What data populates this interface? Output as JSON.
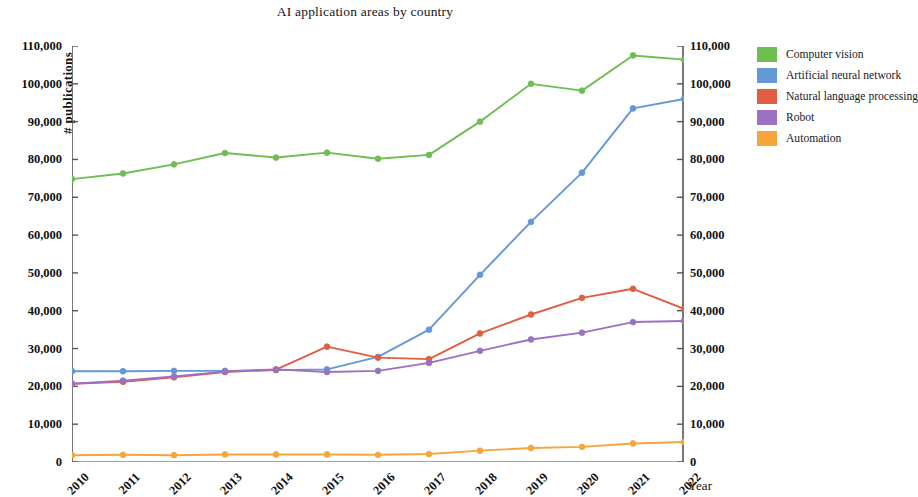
{
  "chart_data": {
    "type": "line",
    "title": "AI application areas by country",
    "xlabel": "Year",
    "ylabel": "# publications",
    "categories": [
      "2010",
      "2011",
      "2012",
      "2013",
      "2014",
      "2015",
      "2016",
      "2017",
      "2018",
      "2019",
      "2020",
      "2021",
      "2022"
    ],
    "x": [
      2010,
      2011,
      2012,
      2013,
      2014,
      2015,
      2016,
      2017,
      2018,
      2019,
      2020,
      2021,
      2022
    ],
    "ylim": [
      0,
      110000
    ],
    "ytick_labels": [
      "0",
      "10,000",
      "20,000",
      "30,000",
      "40,000",
      "50,000",
      "60,000",
      "70,000",
      "80,000",
      "90,000",
      "100,000",
      "110,000"
    ],
    "ytick_values": [
      0,
      10000,
      20000,
      30000,
      40000,
      50000,
      60000,
      70000,
      80000,
      90000,
      100000,
      110000
    ],
    "right_axis_mirror": true,
    "grid": false,
    "legend_position": "right",
    "markers": true,
    "series": [
      {
        "name": "Computer vision",
        "color": "#6EBE52",
        "values": [
          74800,
          76300,
          78700,
          81700,
          80500,
          81800,
          80200,
          81200,
          90000,
          100000,
          98200,
          107500,
          106400
        ]
      },
      {
        "name": "Artificial neural network",
        "color": "#6397D8",
        "values": [
          24000,
          24000,
          24100,
          24100,
          24300,
          24500,
          27800,
          35000,
          49500,
          63500,
          76500,
          93500,
          96000
        ]
      },
      {
        "name": "Natural language processing",
        "color": "#E05E43",
        "values": [
          20700,
          21200,
          22400,
          23800,
          24400,
          30500,
          27600,
          27200,
          34000,
          39000,
          43400,
          45800,
          40500
        ]
      },
      {
        "name": "Robot",
        "color": "#9B72C2",
        "values": [
          20700,
          21500,
          22600,
          23900,
          24500,
          23800,
          24100,
          26200,
          29400,
          32400,
          34200,
          37000,
          37300
        ]
      },
      {
        "name": "Automation",
        "color": "#F6A43C",
        "values": [
          1800,
          1900,
          1800,
          2000,
          2000,
          2000,
          1900,
          2100,
          3000,
          3700,
          4000,
          4900,
          5300
        ]
      }
    ]
  }
}
